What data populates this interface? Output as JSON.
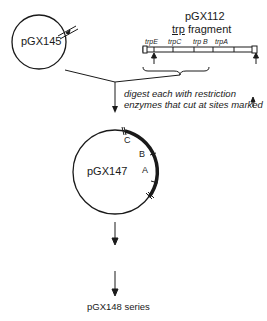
{
  "plasmids": {
    "source": "pGX145",
    "fragment_title": "pGX112",
    "fragment_subtitle_underlined": "trp",
    "fragment_subtitle_rest": " fragment",
    "intermediate": "pGX147",
    "final": "pGX148 series"
  },
  "fragment_genes": [
    "trpE",
    "trpC",
    "trp B",
    "trpA"
  ],
  "instruction": {
    "line1": "digest each with restriction",
    "line2": "enzymes that cut at sites marked"
  },
  "insert_labels": [
    "C",
    "B",
    "A"
  ]
}
